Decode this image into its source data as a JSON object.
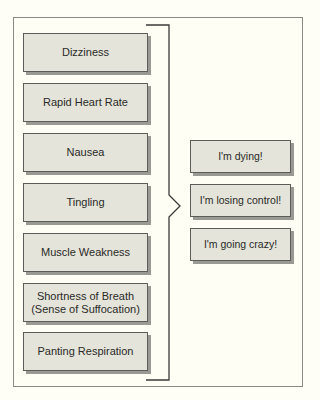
{
  "diagram": {
    "symptoms": [
      {
        "label": "Dizziness",
        "top": 33
      },
      {
        "label": "Rapid Heart Rate",
        "top": 83
      },
      {
        "label": "Nausea",
        "top": 133
      },
      {
        "label": "Tingling",
        "top": 183
      },
      {
        "label": "Muscle Weakness",
        "top": 233
      },
      {
        "label": "Shortness of Breath\n(Sense of Suffocation)",
        "top": 283
      },
      {
        "label": "Panting Respiration",
        "top": 332
      }
    ],
    "thoughts": [
      {
        "label": "I'm dying!",
        "top": 140
      },
      {
        "label": "I'm losing control!",
        "top": 184
      },
      {
        "label": "I'm going crazy!",
        "top": 228
      }
    ],
    "colors": {
      "background": "#fefef6",
      "box_fill": "#e4e4da",
      "box_border": "#5c5c58",
      "box_shadow": "#9a9a94",
      "bracket": "#3a3a38",
      "text": "#2a2a28"
    }
  }
}
